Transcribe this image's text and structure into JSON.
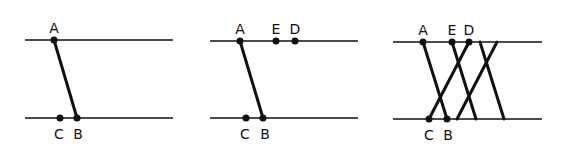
{
  "colors": {
    "ink": "#111111",
    "background": "#ffffff"
  },
  "panels": [
    {
      "id": "panel-1",
      "top_line": {
        "x1": 25,
        "x2": 173,
        "y": 40
      },
      "bottom_line": {
        "x1": 25,
        "x2": 173,
        "y": 118
      },
      "points": [
        {
          "label": "A",
          "x": 54,
          "y": 40,
          "lx": 54,
          "ly": 33
        },
        {
          "label": "C",
          "x": 60,
          "y": 118,
          "lx": 59,
          "ly": 139
        },
        {
          "label": "B",
          "x": 77,
          "y": 118,
          "lx": 78,
          "ly": 139
        }
      ],
      "segments": [
        {
          "x1": 54,
          "y1": 40,
          "x2": 77,
          "y2": 118
        }
      ]
    },
    {
      "id": "panel-2",
      "top_line": {
        "x1": 210,
        "x2": 358,
        "y": 41
      },
      "bottom_line": {
        "x1": 210,
        "x2": 358,
        "y": 118
      },
      "points": [
        {
          "label": "A",
          "x": 240,
          "y": 41,
          "lx": 240,
          "ly": 34
        },
        {
          "label": "E",
          "x": 276,
          "y": 41,
          "lx": 276,
          "ly": 34
        },
        {
          "label": "D",
          "x": 295,
          "y": 41,
          "lx": 295,
          "ly": 34
        },
        {
          "label": "C",
          "x": 246,
          "y": 118,
          "lx": 245,
          "ly": 139
        },
        {
          "label": "B",
          "x": 263,
          "y": 118,
          "lx": 265,
          "ly": 139
        }
      ],
      "segments": [
        {
          "x1": 240,
          "y1": 41,
          "x2": 263,
          "y2": 118
        }
      ]
    },
    {
      "id": "panel-3",
      "top_line": {
        "x1": 393,
        "x2": 542,
        "y": 42
      },
      "bottom_line": {
        "x1": 393,
        "x2": 542,
        "y": 119
      },
      "points": [
        {
          "label": "A",
          "x": 423,
          "y": 42,
          "lx": 423,
          "ly": 35
        },
        {
          "label": "E",
          "x": 452,
          "y": 42,
          "lx": 452,
          "ly": 35
        },
        {
          "label": "D",
          "x": 469,
          "y": 42,
          "lx": 469,
          "ly": 35
        },
        {
          "label": "C",
          "x": 429,
          "y": 119,
          "lx": 429,
          "ly": 140
        },
        {
          "label": "B",
          "x": 447,
          "y": 119,
          "lx": 448,
          "ly": 140
        }
      ],
      "segments": [
        {
          "x1": 423,
          "y1": 42,
          "x2": 447,
          "y2": 119
        },
        {
          "x1": 452,
          "y1": 42,
          "x2": 476,
          "y2": 119
        },
        {
          "x1": 469,
          "y1": 42,
          "x2": 429,
          "y2": 119
        },
        {
          "x1": 480,
          "y1": 42,
          "x2": 504,
          "y2": 119
        },
        {
          "x1": 497,
          "y1": 42,
          "x2": 457,
          "y2": 119
        }
      ]
    }
  ]
}
